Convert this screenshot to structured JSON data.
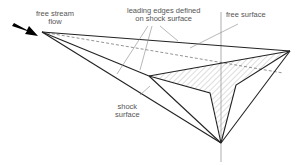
{
  "figure": {
    "labels": {
      "free_stream_line1": "free stream",
      "free_stream_line2": "flow",
      "leading_edges_line1": "leading edges defined",
      "leading_edges_line2": "on shock surface",
      "free_surface": "free surface",
      "shock_line1": "shock",
      "shock_line2": "surface"
    },
    "colors": {
      "lines": "#222222",
      "leaders": "#888888",
      "hatch": "#aaaaaa",
      "text": "#555555"
    },
    "icons": [
      "flow-arrow-icon"
    ]
  }
}
